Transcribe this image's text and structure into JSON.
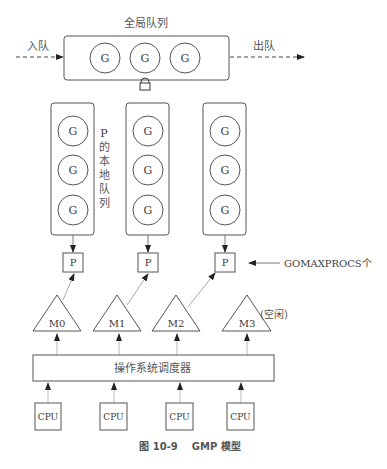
{
  "global_queue": {
    "title": "全局队列",
    "enqueue_label": "入队",
    "dequeue_label": "出队",
    "goroutines": [
      "G",
      "G",
      "G"
    ]
  },
  "local_queues": {
    "label_chars": [
      "P",
      "的",
      "本",
      "地",
      "队",
      "列"
    ],
    "queues": [
      {
        "goroutines": [
          "G",
          "G",
          "G"
        ]
      },
      {
        "goroutines": [
          "G",
          "G",
          "G"
        ]
      },
      {
        "goroutines": [
          "G",
          "G",
          "G"
        ]
      }
    ]
  },
  "processors": {
    "items": [
      "P",
      "P",
      "P"
    ],
    "annotation": "GOMAXPROCS个"
  },
  "machines": {
    "items": [
      "M0",
      "M1",
      "M2",
      "M3"
    ],
    "idle_label": "(空闲)"
  },
  "os_scheduler": {
    "label": "操作系统调度器"
  },
  "cpus": {
    "items": [
      "CPU",
      "CPU",
      "CPU",
      "CPU"
    ]
  },
  "caption": "图 10-9    GMP 模型"
}
